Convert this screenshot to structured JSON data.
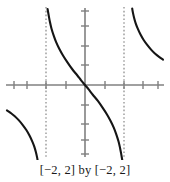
{
  "figure": {
    "caption": "[−2, 2] by [−2, 2]",
    "background_color": "#ffffff",
    "axis_color": "#808080",
    "curve_color": "#151515",
    "asymptote_color": "#909090"
  },
  "chart_data": {
    "type": "line",
    "title": "",
    "subtitle": "",
    "xlabel": "",
    "ylabel": "",
    "caption": "[−2, 2] by [−2, 2]",
    "xlim": [
      -2,
      2
    ],
    "ylim": [
      -2,
      2
    ],
    "grid": false,
    "legend": null,
    "legend_position": "none",
    "xticks": [
      -2,
      -1.5,
      -1,
      -0.5,
      0,
      0.5,
      1,
      1.5,
      2
    ],
    "yticks": [
      -2,
      -1.5,
      -1,
      -0.5,
      0,
      0.5,
      1,
      1.5,
      2
    ],
    "xtick_labels": [
      "",
      "",
      "",
      "",
      "",
      "",
      "",
      "",
      ""
    ],
    "ytick_labels": [
      "",
      "",
      "",
      "",
      "",
      "",
      "",
      "",
      ""
    ],
    "axes": {
      "x_axis_y_value": 0,
      "y_axis_x_value": 0,
      "origin_px": [
        85,
        85
      ],
      "x_px_per_unit": 39,
      "y_px_per_unit": 39
    },
    "annotations": [
      {
        "kind": "vertical-asymptote",
        "x": -1,
        "style": "dotted",
        "label": "x = -1"
      },
      {
        "kind": "vertical-asymptote",
        "x": 1,
        "style": "dotted",
        "label": "x = 1"
      }
    ],
    "series": [
      {
        "name": "branch-left",
        "comment": "lower-left branch, x from -2 to -1",
        "points": [
          [
            -2.0,
            -0.65
          ],
          [
            -1.9,
            -0.72
          ],
          [
            -1.8,
            -0.8
          ],
          [
            -1.7,
            -0.9
          ],
          [
            -1.6,
            -1.02
          ],
          [
            -1.5,
            -1.16
          ],
          [
            -1.42,
            -1.3
          ],
          [
            -1.35,
            -1.45
          ],
          [
            -1.3,
            -1.58
          ],
          [
            -1.26,
            -1.72
          ],
          [
            -1.23,
            -1.85
          ],
          [
            -1.21,
            -1.96
          ]
        ]
      },
      {
        "name": "branch-center",
        "comment": "central branch through origin, x from -1 to 1",
        "points": [
          [
            -0.96,
            1.95
          ],
          [
            -0.93,
            1.78
          ],
          [
            -0.9,
            1.62
          ],
          [
            -0.86,
            1.45
          ],
          [
            -0.8,
            1.26
          ],
          [
            -0.74,
            1.1
          ],
          [
            -0.66,
            0.93
          ],
          [
            -0.56,
            0.75
          ],
          [
            -0.45,
            0.58
          ],
          [
            -0.33,
            0.41
          ],
          [
            -0.2,
            0.25
          ],
          [
            -0.1,
            0.12
          ],
          [
            0.0,
            0.0
          ],
          [
            0.1,
            -0.12
          ],
          [
            0.2,
            -0.25
          ],
          [
            0.33,
            -0.41
          ],
          [
            0.45,
            -0.58
          ],
          [
            0.56,
            -0.75
          ],
          [
            0.66,
            -0.93
          ],
          [
            0.74,
            -1.1
          ],
          [
            0.8,
            -1.26
          ],
          [
            0.86,
            -1.45
          ],
          [
            0.9,
            -1.62
          ],
          [
            0.93,
            -1.78
          ],
          [
            0.96,
            -1.95
          ]
        ]
      },
      {
        "name": "branch-right",
        "comment": "upper-right branch, x from 1 to 2",
        "points": [
          [
            1.21,
            1.96
          ],
          [
            1.23,
            1.85
          ],
          [
            1.26,
            1.72
          ],
          [
            1.3,
            1.58
          ],
          [
            1.35,
            1.45
          ],
          [
            1.42,
            1.3
          ],
          [
            1.5,
            1.16
          ],
          [
            1.6,
            1.02
          ],
          [
            1.7,
            0.9
          ],
          [
            1.8,
            0.8
          ],
          [
            1.9,
            0.72
          ],
          [
            2.0,
            0.65
          ]
        ]
      }
    ]
  }
}
